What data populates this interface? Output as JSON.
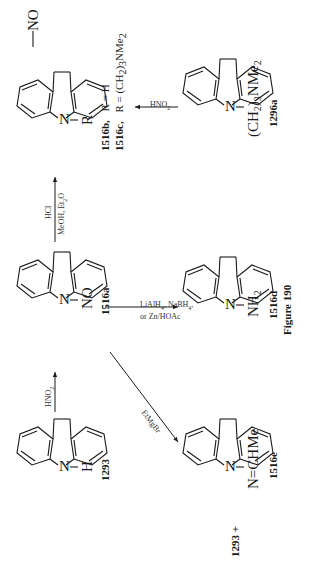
{
  "figure": {
    "caption": "Figure 190"
  },
  "compounds": {
    "c1293": {
      "id": "1293",
      "substituent": "H",
      "n_label": "N"
    },
    "c1516a": {
      "id": "1516a",
      "substituent": "NO",
      "n_label": "N"
    },
    "c1516bc": {
      "n_label": "N",
      "substituent": "R",
      "ring_substituent": "NO",
      "variants": [
        {
          "id": "1516b,",
          "r_label": "R",
          "eq": "=",
          "value": "H"
        },
        {
          "id": "1516c,",
          "r_label": "R",
          "eq": "=",
          "value_main": "(CH",
          "value_sub": "2",
          "value_mid": ")",
          "value_sub2": "3",
          "value_end": "NMe",
          "value_sub3": "2"
        }
      ]
    },
    "c1296a": {
      "id": "1296a",
      "n_label": "N",
      "sub_main": "(CH",
      "sub_s1": "2",
      "sub_mid": ")",
      "sub_s2": "3",
      "sub_end": "NMe",
      "sub_s3": "2"
    },
    "c1516d": {
      "id": "1516d",
      "n_label": "N",
      "sub_main": "NH",
      "sub_s1": "2"
    },
    "c1516e": {
      "id": "1516e",
      "n_label": "N",
      "sub_main": "N=CHMe",
      "coproduct": "1293 +"
    }
  },
  "reagents": {
    "r_1293_to_1516a": {
      "main": "HNO",
      "sub": "2"
    },
    "r_1516a_to_1516bc": {
      "top": "HCl",
      "bottom_main": "MeOH, Et",
      "bottom_sub": "2",
      "bottom_end": "O"
    },
    "r_1296a_to_1516bc": {
      "main": "HNO",
      "sub": "2"
    },
    "r_1516a_to_1516d": {
      "line1_a": "LiAlH",
      "line1_s": "4",
      "line1_b": ", NaBH",
      "line1_s2": "4",
      "line1_c": ",",
      "line2": "or Zn/HOAc"
    },
    "r_1516a_to_1516e": {
      "main": "EtMgBr"
    }
  },
  "colors": {
    "ink": "#1a1a1a",
    "background": "#ffffff"
  }
}
